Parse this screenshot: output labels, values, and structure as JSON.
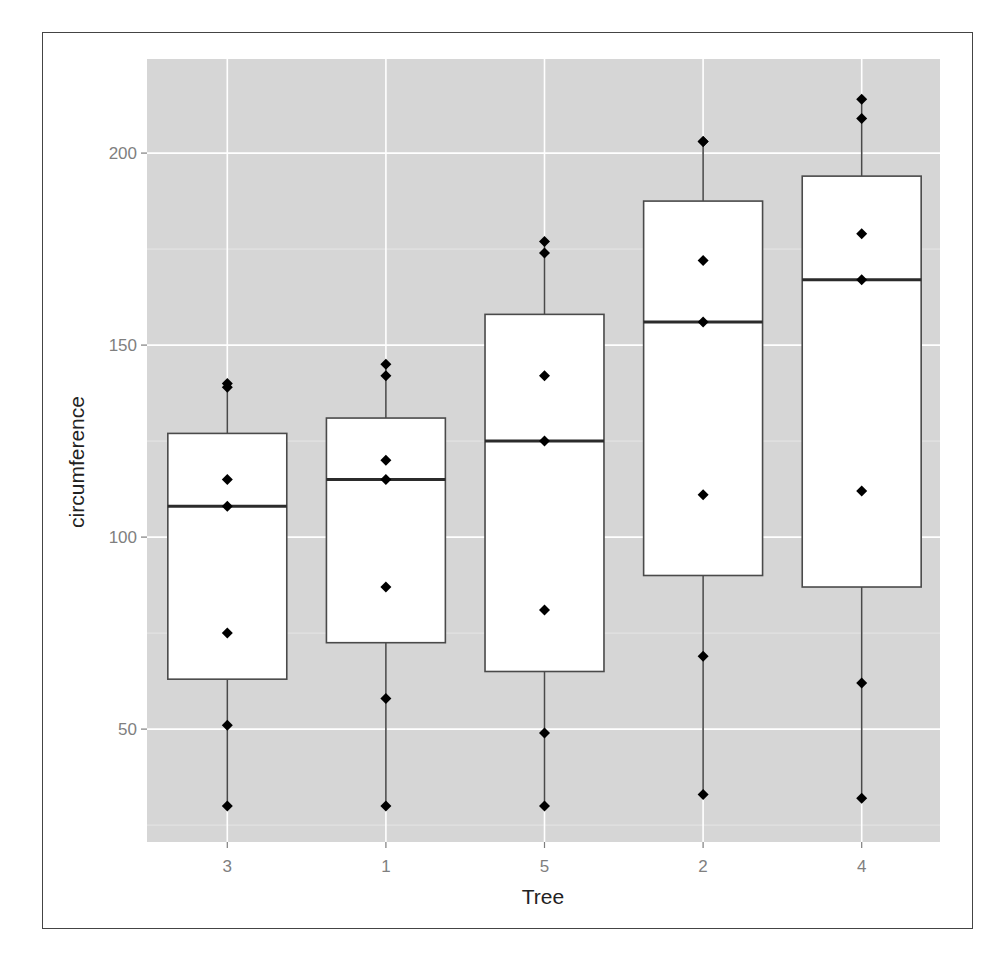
{
  "chart_data": {
    "type": "boxplot",
    "title": "",
    "xlabel": "Tree",
    "ylabel": "circumference",
    "categories": [
      "3",
      "1",
      "5",
      "2",
      "4"
    ],
    "ylim": [
      20.6,
      224.5
    ],
    "yticks": [
      50,
      100,
      150,
      200
    ],
    "grid": true,
    "legend": "none",
    "series": [
      {
        "name": "3",
        "points": [
          30,
          51,
          75,
          108,
          115,
          139,
          140
        ],
        "q1": 63,
        "median": 108,
        "q3": 127,
        "whisker_low": 30,
        "whisker_high": 140
      },
      {
        "name": "1",
        "points": [
          30,
          58,
          87,
          115,
          120,
          142,
          145
        ],
        "q1": 72.5,
        "median": 115,
        "q3": 131,
        "whisker_low": 30,
        "whisker_high": 145
      },
      {
        "name": "5",
        "points": [
          30,
          49,
          81,
          125,
          142,
          174,
          177
        ],
        "q1": 65,
        "median": 125,
        "q3": 158,
        "whisker_low": 30,
        "whisker_high": 177
      },
      {
        "name": "2",
        "points": [
          33,
          69,
          111,
          156,
          172,
          203,
          203
        ],
        "q1": 90,
        "median": 156,
        "q3": 187.5,
        "whisker_low": 33,
        "whisker_high": 203
      },
      {
        "name": "4",
        "points": [
          32,
          62,
          112,
          167,
          179,
          209,
          214
        ],
        "q1": 87,
        "median": 167,
        "q3": 194,
        "whisker_low": 32,
        "whisker_high": 214
      }
    ]
  },
  "colors": {
    "panel": "#d6d6d6",
    "grid_major": "#ffffff",
    "grid_minor": "#e6e6e6",
    "box_fill": "#ffffff",
    "box_line": "#4a4a4a",
    "median_line": "#2b2b2b",
    "point": "#000000"
  }
}
